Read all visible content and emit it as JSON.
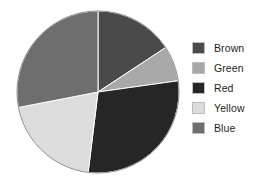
{
  "chart_data": {
    "type": "pie",
    "title": "",
    "subtitle": "",
    "xlabel": "",
    "ylabel": "",
    "grid": false,
    "legend_position": "right",
    "start_angle_deg": 0,
    "direction": "clockwise",
    "center": {
      "x": 98,
      "y": 92
    },
    "radius": 81,
    "categories": [
      "Brown",
      "Green",
      "Red",
      "Yellow",
      "Blue"
    ],
    "values": [
      15.7,
      7.0,
      29.2,
      20.0,
      28.1
    ],
    "units": "percent",
    "angles_deg": [
      56.7,
      25.3,
      105.0,
      72.0,
      101.0
    ],
    "boundaries_deg": [
      0,
      56.7,
      82.0,
      187.0,
      259.0,
      360
    ],
    "colors": [
      "#4a4a4a",
      "#a8a8a8",
      "#262626",
      "#dcdcdc",
      "#6e6e6e"
    ],
    "slices": [
      {
        "label": "Brown",
        "value": 15.7,
        "angle_deg": 56.7,
        "start_deg": 0.0,
        "end_deg": 56.7,
        "color": "#4a4a4a"
      },
      {
        "label": "Green",
        "value": 7.0,
        "angle_deg": 25.3,
        "start_deg": 56.7,
        "end_deg": 82.0,
        "color": "#a8a8a8"
      },
      {
        "label": "Red",
        "value": 29.2,
        "angle_deg": 105.0,
        "start_deg": 82.0,
        "end_deg": 187.0,
        "color": "#262626"
      },
      {
        "label": "Yellow",
        "value": 20.0,
        "angle_deg": 72.0,
        "start_deg": 187.0,
        "end_deg": 259.0,
        "color": "#dcdcdc"
      },
      {
        "label": "Blue",
        "value": 28.1,
        "angle_deg": 101.0,
        "start_deg": 259.0,
        "end_deg": 360.0,
        "color": "#6e6e6e"
      }
    ]
  },
  "legend": {
    "items": [
      {
        "label": "Brown",
        "color": "#4a4a4a"
      },
      {
        "label": "Green",
        "color": "#a8a8a8"
      },
      {
        "label": "Red",
        "color": "#262626"
      },
      {
        "label": "Yellow",
        "color": "#dcdcdc"
      },
      {
        "label": "Blue",
        "color": "#6e6e6e"
      }
    ]
  },
  "style": {
    "background": "#ffffff",
    "slice_edge_color": "#ffffff",
    "pie_outline_color": "#8c8c8c",
    "text_color": "#231f20"
  }
}
